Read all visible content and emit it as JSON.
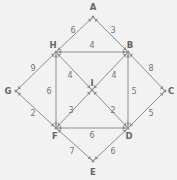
{
  "figure": {
    "kind": "weighted-undirected-graph",
    "background_color": "#f2f2f2",
    "line_color": "#8e8e8e",
    "text_color": "#6f6f6f",
    "width": 177,
    "height": 180
  },
  "chart_data": {
    "type": "diagram",
    "title": "",
    "nodes": [
      {
        "id": "A",
        "label": "A",
        "x": 93,
        "y": 17,
        "label_x": 93,
        "label_y": 7
      },
      {
        "id": "B",
        "label": "B",
        "x": 128,
        "y": 52,
        "label_x": 130,
        "label_y": 45
      },
      {
        "id": "C",
        "label": "C",
        "x": 165,
        "y": 91,
        "label_x": 171,
        "label_y": 91
      },
      {
        "id": "D",
        "label": "D",
        "x": 128,
        "y": 128,
        "label_x": 129,
        "label_y": 136
      },
      {
        "id": "E",
        "label": "E",
        "x": 93,
        "y": 161,
        "label_x": 93,
        "label_y": 172
      },
      {
        "id": "F",
        "label": "F",
        "x": 56,
        "y": 128,
        "label_x": 55,
        "label_y": 136
      },
      {
        "id": "G",
        "label": "G",
        "x": 16,
        "y": 91,
        "label_x": 8,
        "label_y": 91
      },
      {
        "id": "H",
        "label": "H",
        "x": 56,
        "y": 52,
        "label_x": 53,
        "label_y": 45
      },
      {
        "id": "I",
        "label": "I",
        "x": 92,
        "y": 90,
        "label_x": 92,
        "label_y": 83
      }
    ],
    "edges": [
      {
        "from": "A",
        "to": "H",
        "weight": "6",
        "label_x": 73,
        "label_y": 30
      },
      {
        "from": "A",
        "to": "B",
        "weight": "3",
        "label_x": 113,
        "label_y": 30
      },
      {
        "from": "H",
        "to": "B",
        "weight": "4",
        "label_x": 92,
        "label_y": 45
      },
      {
        "from": "G",
        "to": "H",
        "weight": "9",
        "label_x": 33,
        "label_y": 68
      },
      {
        "from": "B",
        "to": "C",
        "weight": "8",
        "label_x": 151,
        "label_y": 68
      },
      {
        "from": "H",
        "to": "F",
        "weight": "6",
        "label_x": 49,
        "label_y": 91
      },
      {
        "from": "B",
        "to": "D",
        "weight": "5",
        "label_x": 134,
        "label_y": 91
      },
      {
        "from": "G",
        "to": "F",
        "weight": "2",
        "label_x": 33,
        "label_y": 113
      },
      {
        "from": "C",
        "to": "D",
        "weight": "5",
        "label_x": 151,
        "label_y": 113
      },
      {
        "from": "F",
        "to": "D",
        "weight": "6",
        "label_x": 92,
        "label_y": 135
      },
      {
        "from": "F",
        "to": "E",
        "weight": "7",
        "label_x": 72,
        "label_y": 151
      },
      {
        "from": "E",
        "to": "D",
        "weight": "6",
        "label_x": 113,
        "label_y": 151
      },
      {
        "from": "H",
        "to": "I",
        "weight": "4",
        "label_x": 70,
        "label_y": 75
      },
      {
        "from": "I",
        "to": "B",
        "weight": "4",
        "label_x": 114,
        "label_y": 75
      },
      {
        "from": "F",
        "to": "I",
        "weight": "3",
        "label_x": 71,
        "label_y": 110
      },
      {
        "from": "I",
        "to": "D",
        "weight": "2",
        "label_x": 113,
        "label_y": 110
      }
    ],
    "arrow_targets": [
      "H",
      "B",
      "F",
      "D",
      "G",
      "C",
      "A",
      "E",
      "I"
    ]
  }
}
